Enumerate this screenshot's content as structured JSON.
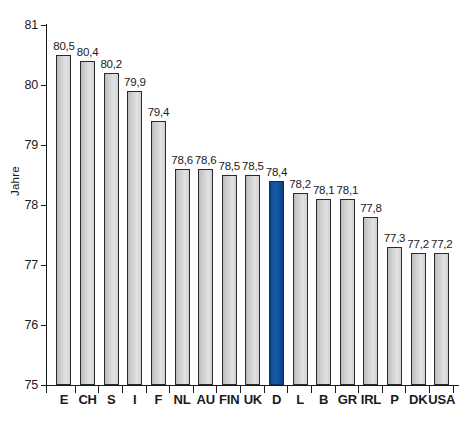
{
  "chart_data": {
    "type": "bar",
    "title": "",
    "xlabel": "",
    "ylabel": "Jahre",
    "ylim": [
      75,
      81
    ],
    "ytick_labels": [
      "81",
      "80",
      "79",
      "78",
      "77",
      "76",
      "75"
    ],
    "yticks": [
      81,
      80,
      79,
      78,
      77,
      76,
      75
    ],
    "grid": false,
    "legend": "none",
    "categories": [
      "E",
      "CH",
      "S",
      "I",
      "F",
      "NL",
      "AU",
      "FIN",
      "UK",
      "D",
      "L",
      "B",
      "GR",
      "IRL",
      "P",
      "DK",
      "USA"
    ],
    "values": [
      80.5,
      80.4,
      80.2,
      79.9,
      79.4,
      78.6,
      78.6,
      78.5,
      78.5,
      78.4,
      78.2,
      78.1,
      78.1,
      77.8,
      77.3,
      77.2,
      77.2
    ],
    "value_labels": [
      "80,5",
      "80,4",
      "80,2",
      "79,9",
      "79,4",
      "78,6",
      "78,6",
      "78,5",
      "78,5",
      "78,4",
      "78,2",
      "78,1",
      "78,1",
      "77,8",
      "77,3",
      "77,2",
      "77,2"
    ],
    "highlight_index": 9,
    "bar_color": "#d4d4d4",
    "bar_border_color": "#2b2b2b",
    "highlight_color": "#14559f",
    "highlight_border_color": "#0b2f5e",
    "axis_color": "#1b1b1b",
    "background_color": "#ffffff"
  }
}
